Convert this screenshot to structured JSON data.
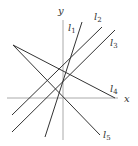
{
  "diagram": {
    "type": "coordinate-lines",
    "axes": {
      "x_label": "x",
      "y_label": "y",
      "color": "#aaaaaa",
      "origin": [
        63,
        98
      ],
      "x_axis": {
        "x1": 7,
        "y1": 98,
        "x2": 118,
        "y2": 98
      },
      "y_axis": {
        "x1": 63,
        "y1": 20,
        "x2": 63,
        "y2": 140
      }
    },
    "line_color": "#333333",
    "lines": [
      {
        "name": "l",
        "sub": "1",
        "x1": 45,
        "y1": 137,
        "x2": 82,
        "y2": 22,
        "lx": 68,
        "ly": 31
      },
      {
        "name": "l",
        "sub": "2",
        "x1": 12,
        "y1": 115,
        "x2": 102,
        "y2": 27,
        "lx": 94,
        "ly": 20
      },
      {
        "name": "l",
        "sub": "3",
        "x1": 12,
        "y1": 132,
        "x2": 115,
        "y2": 30,
        "lx": 110,
        "ly": 46
      },
      {
        "name": "l",
        "sub": "4",
        "x1": 13,
        "y1": 45,
        "x2": 115,
        "y2": 98,
        "lx": 110,
        "ly": 92
      },
      {
        "name": "l",
        "sub": "5",
        "x1": 13,
        "y1": 45,
        "x2": 100,
        "y2": 135,
        "lx": 103,
        "ly": 138
      }
    ]
  }
}
